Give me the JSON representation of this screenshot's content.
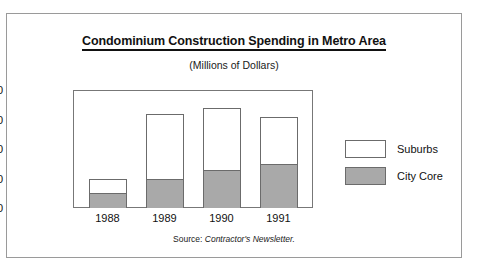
{
  "top_caption": "",
  "figure": {
    "title": "Condominium Construction Spending in Metro Area",
    "subtitle": "(Millions of Dollars)",
    "source_label": "Source:",
    "source_value": "Contractor's Newsletter."
  },
  "legend": {
    "items": [
      {
        "label": "Suburbs",
        "color": "#ffffff"
      },
      {
        "label": "City Core",
        "color": "#a9a9a9"
      }
    ]
  },
  "chart_data": {
    "type": "bar",
    "stacked": true,
    "title": "Condominium Construction Spending in Metro Area",
    "subtitle": "(Millions of Dollars)",
    "xlabel": "",
    "ylabel": "",
    "ylim": [
      4.0,
      8.0
    ],
    "ytick_step": 1.0,
    "ytick_labels": [
      "8.0",
      "7.0",
      "6.0",
      "5.0",
      "4.0"
    ],
    "ytick_values": [
      8.0,
      7.0,
      6.0,
      5.0,
      4.0
    ],
    "grid": false,
    "legend_position": "right",
    "categories": [
      "1988",
      "1989",
      "1990",
      "1991"
    ],
    "series": [
      {
        "name": "City Core",
        "color": "#a9a9a9",
        "values": [
          4.5,
          5.0,
          5.3,
          5.5
        ]
      },
      {
        "name": "Suburbs",
        "color": "#ffffff",
        "values": [
          0.5,
          2.2,
          2.1,
          1.6
        ]
      }
    ],
    "totals": [
      5.0,
      7.2,
      7.4,
      7.1
    ],
    "source": "Source: Contractor's Newsletter."
  }
}
